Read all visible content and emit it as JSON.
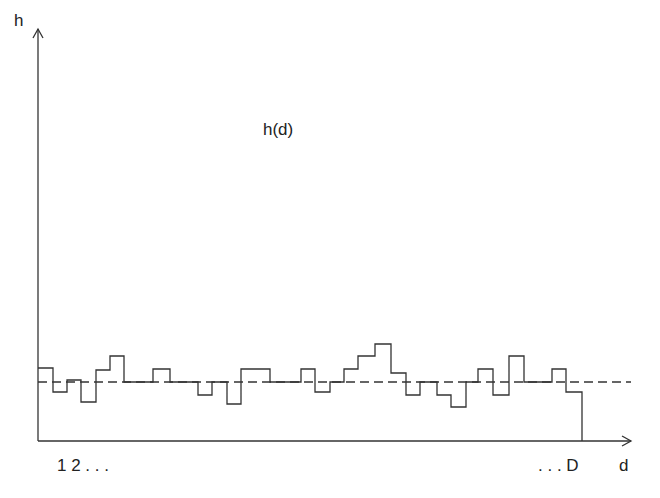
{
  "chart_data": {
    "type": "line",
    "subtype": "step",
    "title": "",
    "curve_label": "h(d)",
    "xlabel": "d",
    "ylabel": "h",
    "x_tick_labels_left": "1 2 . . .",
    "x_tick_labels_right": ". . . D",
    "grid": false,
    "legend": null,
    "reference_line": {
      "style": "dashed",
      "y_px": 382,
      "meaning": "mean level"
    },
    "steps": [
      {
        "x0": 38,
        "x1": 53,
        "y": 368
      },
      {
        "x0": 53,
        "x1": 67,
        "y": 392
      },
      {
        "x0": 67,
        "x1": 81,
        "y": 380
      },
      {
        "x0": 81,
        "x1": 96,
        "y": 402
      },
      {
        "x0": 96,
        "x1": 110,
        "y": 370
      },
      {
        "x0": 110,
        "x1": 124,
        "y": 356
      },
      {
        "x0": 124,
        "x1": 153,
        "y": 382
      },
      {
        "x0": 153,
        "x1": 170,
        "y": 369
      },
      {
        "x0": 170,
        "x1": 198,
        "y": 382
      },
      {
        "x0": 198,
        "x1": 212,
        "y": 395
      },
      {
        "x0": 212,
        "x1": 227,
        "y": 382
      },
      {
        "x0": 227,
        "x1": 241,
        "y": 404
      },
      {
        "x0": 241,
        "x1": 270,
        "y": 369
      },
      {
        "x0": 270,
        "x1": 301,
        "y": 382
      },
      {
        "x0": 301,
        "x1": 315,
        "y": 369
      },
      {
        "x0": 315,
        "x1": 330,
        "y": 392
      },
      {
        "x0": 330,
        "x1": 344,
        "y": 382
      },
      {
        "x0": 344,
        "x1": 358,
        "y": 369
      },
      {
        "x0": 358,
        "x1": 375,
        "y": 356
      },
      {
        "x0": 375,
        "x1": 391,
        "y": 344
      },
      {
        "x0": 391,
        "x1": 406,
        "y": 373
      },
      {
        "x0": 406,
        "x1": 420,
        "y": 395
      },
      {
        "x0": 420,
        "x1": 437,
        "y": 382
      },
      {
        "x0": 437,
        "x1": 451,
        "y": 395
      },
      {
        "x0": 451,
        "x1": 466,
        "y": 407
      },
      {
        "x0": 466,
        "x1": 478,
        "y": 382
      },
      {
        "x0": 478,
        "x1": 493,
        "y": 369
      },
      {
        "x0": 493,
        "x1": 509,
        "y": 395
      },
      {
        "x0": 509,
        "x1": 524,
        "y": 356
      },
      {
        "x0": 524,
        "x1": 552,
        "y": 382
      },
      {
        "x0": 552,
        "x1": 566,
        "y": 369
      },
      {
        "x0": 566,
        "x1": 582,
        "y": 392
      }
    ],
    "axes": {
      "origin": {
        "x": 38,
        "y": 441
      },
      "x_end": 631,
      "y_top": 29
    }
  },
  "labels": {
    "y_axis": "h",
    "x_axis": "d",
    "curve": "h(d)",
    "x_start": "1 2 . . .",
    "x_end": ". . . D"
  },
  "colors": {
    "line": "#333333",
    "background": "#ffffff"
  }
}
